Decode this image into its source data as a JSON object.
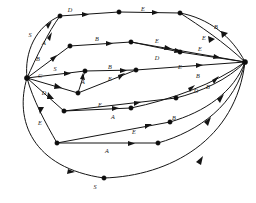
{
  "figure": {
    "name": "directed-labeled-graph",
    "background_color": "#ffffff",
    "stroke_color": "#141414",
    "label_color": "#1a1a1a",
    "width": 256,
    "height": 203
  },
  "nodes": [
    {
      "id": "L",
      "label": "",
      "x": 27,
      "y": 78
    },
    {
      "id": "R",
      "label": "",
      "x": 245,
      "y": 62
    },
    {
      "id": "n1",
      "label": "",
      "x": 60,
      "y": 16
    },
    {
      "id": "n2",
      "label": "",
      "x": 119,
      "y": 12
    },
    {
      "id": "n3",
      "label": "",
      "x": 180,
      "y": 13
    },
    {
      "id": "n4",
      "label": "",
      "x": 70,
      "y": 46
    },
    {
      "id": "n5",
      "label": "",
      "x": 131,
      "y": 42
    },
    {
      "id": "n6",
      "label": "",
      "x": 180,
      "y": 52
    },
    {
      "id": "n7",
      "label": "",
      "x": 85,
      "y": 71
    },
    {
      "id": "n8",
      "label": "",
      "x": 136,
      "y": 70
    },
    {
      "id": "n9",
      "label": "",
      "x": 78,
      "y": 93
    },
    {
      "id": "n10",
      "label": "",
      "x": 64,
      "y": 111
    },
    {
      "id": "n11",
      "label": "",
      "x": 131,
      "y": 108
    },
    {
      "id": "n12",
      "label": "",
      "x": 176,
      "y": 98
    },
    {
      "id": "n13",
      "label": "",
      "x": 57,
      "y": 143
    },
    {
      "id": "n14",
      "label": "",
      "x": 170,
      "y": 122
    },
    {
      "id": "n15",
      "label": "",
      "x": 158,
      "y": 143
    },
    {
      "id": "n16",
      "label": "",
      "x": 104,
      "y": 178
    }
  ],
  "edges": [
    {
      "id": "e1",
      "from": "L",
      "to": "n1",
      "label": "S",
      "label_x": 30,
      "label_y": 36
    },
    {
      "id": "e2",
      "from": "L",
      "to": "n1",
      "label": "A",
      "label_x": 44,
      "label_y": 44
    },
    {
      "id": "e3",
      "from": "n1",
      "to": "n2",
      "label": "D",
      "label_x": 70,
      "label_y": 11
    },
    {
      "id": "e4",
      "from": "n2",
      "to": "n3",
      "label": "E",
      "label_x": 143,
      "label_y": 10
    },
    {
      "id": "e5",
      "from": "n3",
      "to": "R",
      "label": "B",
      "label_x": 216,
      "label_y": 28
    },
    {
      "id": "e6",
      "from": "n3",
      "to": "R",
      "label": "E",
      "label_x": 204,
      "label_y": 39
    },
    {
      "id": "e7",
      "from": "L",
      "to": "n4",
      "label": "B",
      "label_x": 38,
      "label_y": 60
    },
    {
      "id": "e8",
      "from": "n4",
      "to": "n5",
      "label": "B",
      "label_x": 97,
      "label_y": 40
    },
    {
      "id": "e9",
      "from": "n5",
      "to": "n6",
      "label": "E",
      "label_x": 157,
      "label_y": 42
    },
    {
      "id": "e10",
      "from": "n6",
      "to": "R",
      "label": "E",
      "label_x": 200,
      "label_y": 50
    },
    {
      "id": "e11",
      "from": "n5",
      "to": "R",
      "label": "D",
      "label_x": 157,
      "label_y": 59
    },
    {
      "id": "e12",
      "from": "L",
      "to": "n7",
      "label": "S",
      "label_x": 55,
      "label_y": 70
    },
    {
      "id": "e13",
      "from": "n7",
      "to": "n8",
      "label": "B",
      "label_x": 110,
      "label_y": 68
    },
    {
      "id": "e14",
      "from": "n8",
      "to": "R",
      "label": "E",
      "label_x": 180,
      "label_y": 68
    },
    {
      "id": "e15",
      "from": "L",
      "to": "n9",
      "label": "C",
      "label_x": 40,
      "label_y": 77
    },
    {
      "id": "e16",
      "from": "n9",
      "to": "n7",
      "label": "A",
      "label_x": 83,
      "label_y": 83
    },
    {
      "id": "e17",
      "from": "n9",
      "to": "n8",
      "label": "E",
      "label_x": 110,
      "label_y": 80
    },
    {
      "id": "e18",
      "from": "L",
      "to": "n10",
      "label": "D",
      "label_x": 44,
      "label_y": 94
    },
    {
      "id": "e19",
      "from": "n10",
      "to": "n11",
      "label": "E",
      "label_x": 100,
      "label_y": 106
    },
    {
      "id": "e20",
      "from": "n11",
      "to": "R",
      "label": "D",
      "label_x": 196,
      "label_y": 92
    },
    {
      "id": "e21",
      "from": "n10",
      "to": "n12",
      "label": "A",
      "label_x": 113,
      "label_y": 118
    },
    {
      "id": "e22",
      "from": "n12",
      "to": "R",
      "label": "B",
      "label_x": 198,
      "label_y": 77
    },
    {
      "id": "e23",
      "from": "L",
      "to": "n13",
      "label": "E",
      "label_x": 40,
      "label_y": 124
    },
    {
      "id": "e24",
      "from": "n13",
      "to": "n14",
      "label": "E",
      "label_x": 134,
      "label_y": 133
    },
    {
      "id": "e25",
      "from": "n13",
      "to": "n15",
      "label": "A",
      "label_x": 107,
      "label_y": 152
    },
    {
      "id": "e26",
      "from": "n14",
      "to": "R",
      "label": "B",
      "label_x": 208,
      "label_y": 88
    },
    {
      "id": "e27",
      "from": "n15",
      "to": "R",
      "label": "B",
      "label_x": 174,
      "label_y": 119
    },
    {
      "id": "e28",
      "from": "L",
      "to": "n16",
      "label": "S",
      "label_x": 95,
      "label_y": 188
    },
    {
      "id": "e29",
      "from": "n16",
      "to": "R",
      "label": "",
      "label_x": 200,
      "label_y": 160
    }
  ],
  "alphabet": [
    "A",
    "B",
    "C",
    "D",
    "E",
    "S"
  ],
  "counts": {
    "nodes": 18,
    "edges": 29
  }
}
